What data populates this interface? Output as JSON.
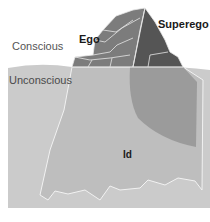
{
  "diagram": {
    "type": "iceberg model of the mind",
    "labels": {
      "conscious": "Conscious",
      "unconscious": "Unconscious",
      "ego": "Ego",
      "superego": "Superego",
      "id": "Id"
    },
    "colors": {
      "background": "#ffffff",
      "water": "#c9c9c9",
      "iceberg_underwater": "#bdbdbd",
      "superego_underwater": "#9a9a9a",
      "ego_rock": "#7a7a7a",
      "superego_rock": "#555555",
      "outline": "#f0f0f0"
    }
  }
}
